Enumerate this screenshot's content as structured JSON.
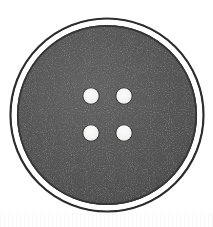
{
  "image": {
    "title": "Four-hole sewing button",
    "subject": "button",
    "background_color": "#ffffff",
    "width": 213,
    "height": 227
  },
  "button": {
    "label": "button-body",
    "shape": "circle",
    "center_x": 107,
    "center_y": 115,
    "outer_ring_radius": 97,
    "gap_ring_radius": 93,
    "body_radius": 90,
    "body_color": "#585858",
    "body_color_dark": "#4a4a4a",
    "body_color_light": "#676767",
    "outer_ring_color": "#2c2c2c",
    "gap_color": "#ffffff",
    "body_edge_color": "#343434",
    "texture": "mottled-matte",
    "hole_count": 4,
    "hole_color": "#f4f4f2",
    "hole_rim_color": "#2b2b2b",
    "hole_radius": 8
  },
  "holes": [
    {
      "name": "hole-top-left",
      "cx": 91,
      "cy": 96
    },
    {
      "name": "hole-top-right",
      "cx": 124,
      "cy": 96
    },
    {
      "name": "hole-bottom-left",
      "cx": 91,
      "cy": 133
    },
    {
      "name": "hole-bottom-right",
      "cx": 124,
      "cy": 133
    }
  ],
  "caption": {
    "text": ""
  }
}
